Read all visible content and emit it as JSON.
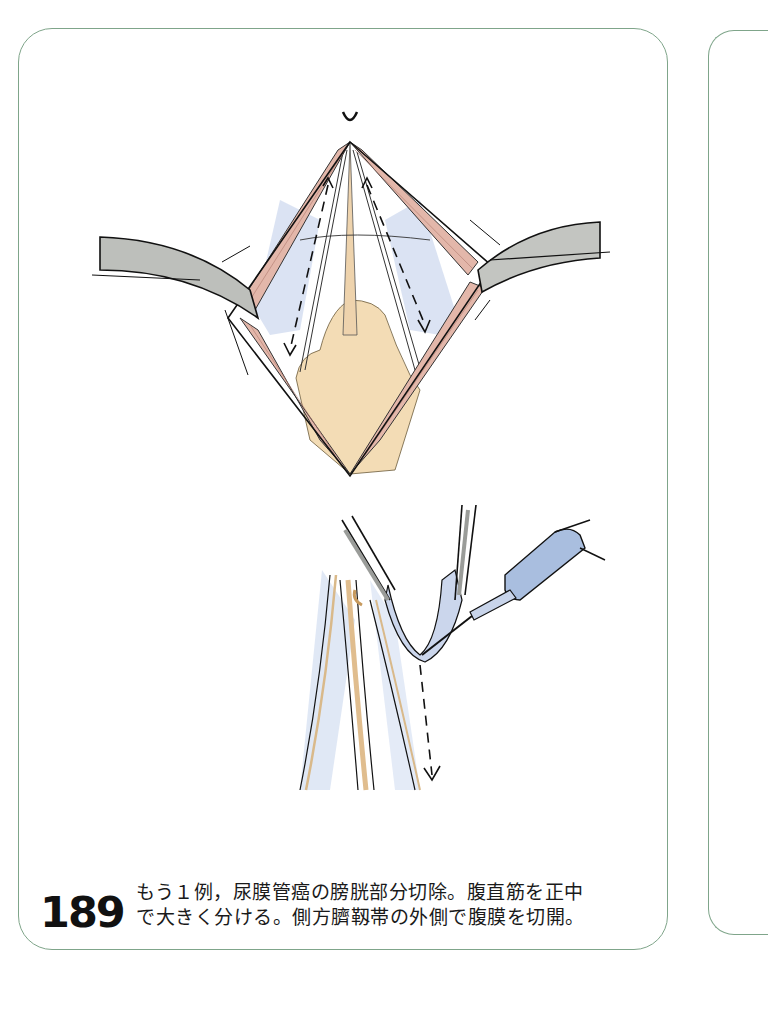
{
  "page": {
    "figure": {
      "number": "189",
      "caption_line1": "もう１例，尿膜管癌の膀胱部分切除。腹直筋を正中",
      "caption_line2": "で大きく分ける。側方臍靱帯の外側で腹膜を切開。"
    },
    "illustrations": [
      {
        "name": "upper-illustration",
        "depicts": "midline abdominal incision with retractors, rectus muscles separated, dashed arrows indicating incision direction"
      },
      {
        "name": "lower-illustration",
        "depicts": "forceps lifting peritoneum with electrocautery, dashed arrow indicating incision direction lateral to umbilical ligaments"
      }
    ],
    "colors": {
      "frame_border": "#7fa58a",
      "muscle": "#e3b7aa",
      "retractor": "#b8bab6",
      "fat": "#f3dcb5",
      "peritoneum_shade": "#c8d6ec",
      "instrument": "#a9bedf"
    }
  }
}
